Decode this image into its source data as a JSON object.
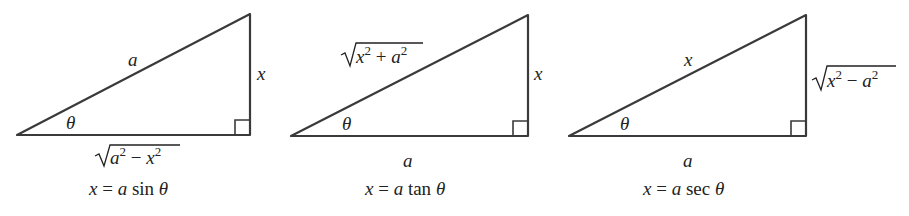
{
  "figure": {
    "triangles": [
      {
        "id": "sin",
        "hypotenuse_label": "a",
        "opposite_label": "x",
        "adjacent_label": "√(a² − x²)",
        "adjacent_parts": {
          "base1": "a",
          "exp1": "2",
          "op": " − ",
          "base2": "x",
          "exp2": "2"
        },
        "angle_label": "θ",
        "caption": {
          "lhs": "x",
          "eq": " = ",
          "coef": "a",
          "fn": " sin ",
          "var": "θ"
        }
      },
      {
        "id": "tan",
        "hypotenuse_label": "√(x² + a²)",
        "hypotenuse_parts": {
          "base1": "x",
          "exp1": "2",
          "op": " + ",
          "base2": "a",
          "exp2": "2"
        },
        "opposite_label": "x",
        "adjacent_label": "a",
        "angle_label": "θ",
        "caption": {
          "lhs": "x",
          "eq": " = ",
          "coef": "a",
          "fn": " tan ",
          "var": "θ"
        }
      },
      {
        "id": "sec",
        "hypotenuse_label": "x",
        "opposite_label": "√(x² − a²)",
        "opposite_parts": {
          "base1": "x",
          "exp1": "2",
          "op": " − ",
          "base2": "a",
          "exp2": "2"
        },
        "adjacent_label": "a",
        "angle_label": "θ",
        "caption": {
          "lhs": "x",
          "eq": " = ",
          "coef": "a",
          "fn": " sec ",
          "var": "θ"
        }
      }
    ]
  }
}
